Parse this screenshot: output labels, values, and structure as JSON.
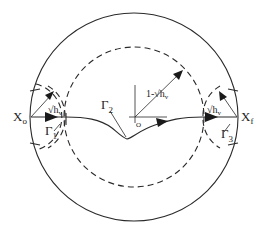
{
  "diagram": {
    "type": "geometric contour diagram",
    "labels": {
      "start_point": "X",
      "start_sub": "o",
      "end_point": "X",
      "end_sub": "f",
      "gamma1": "Γ",
      "gamma1_sub": "1",
      "gamma2": "Γ",
      "gamma2_sub": "2",
      "gamma3": "Γ",
      "gamma3_sub": "3",
      "sqrt_hv_left": "√h",
      "sqrt_hv_left_sub": "v",
      "sqrt_hv_right": "√h",
      "sqrt_hv_right_sub": "v",
      "inner_radius": "1-√h",
      "inner_radius_sub": "v",
      "origin": "O"
    },
    "elements": {
      "outer_circle": "solid unit circle",
      "inner_circle": "dashed circle of radius 1-√h_v",
      "small_circle_left": "dashed circle of radius √h_v centered at X_o",
      "small_circle_right": "dashed circle of radius √h_v centered at X_f",
      "path": "curve from X_o to X_f passing below origin",
      "axes": "coordinate axes at origin O"
    },
    "colors": {
      "stroke": "#2a2a2a",
      "background": "#ffffff"
    }
  }
}
